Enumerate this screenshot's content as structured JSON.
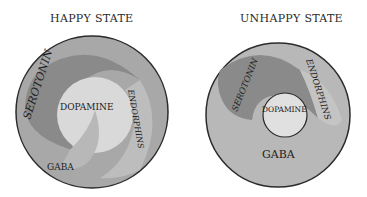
{
  "diagrams": [
    {
      "title": "HAPPY STATE",
      "labels": {
        "serotonin": "SEROTONIN",
        "dopamine": "DOPAMINE",
        "endorphins": "ENDORPHINS",
        "gaba": "GABA"
      }
    },
    {
      "title": "UNHAPPY STATE",
      "labels": {
        "serotonin": "SEROTONIN",
        "dopamine": "DOPAMINE",
        "endorphins": "ENDORPHINS",
        "gaba": "GABA"
      }
    }
  ],
  "colors": {
    "outline": "#2b2b2b",
    "serotonin": "#8a8a8a",
    "endorphins": "#bdbdbd",
    "dopamine": "#d9d9d9",
    "gaba": "#a6a6a6"
  }
}
